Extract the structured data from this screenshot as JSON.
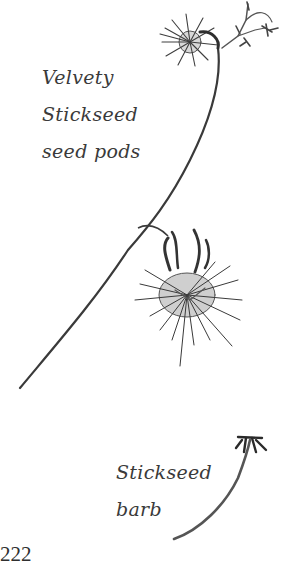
{
  "captions": {
    "seed_pods": [
      "Velvety",
      "Stickseed",
      "seed pods"
    ],
    "barb": [
      "Stickseed",
      "barb"
    ]
  },
  "page_number": "222",
  "colors": {
    "ink": "#2e2e2e",
    "ink_light": "#6a6a6a",
    "text": "#3a3a3a",
    "background": "#ffffff"
  },
  "illustrations": [
    {
      "name": "velvety-stickseed-plant",
      "description": "stem with two bristly seed pods and small flowers"
    },
    {
      "name": "stickseed-barb",
      "description": "single curved barb with hooked tip"
    }
  ]
}
